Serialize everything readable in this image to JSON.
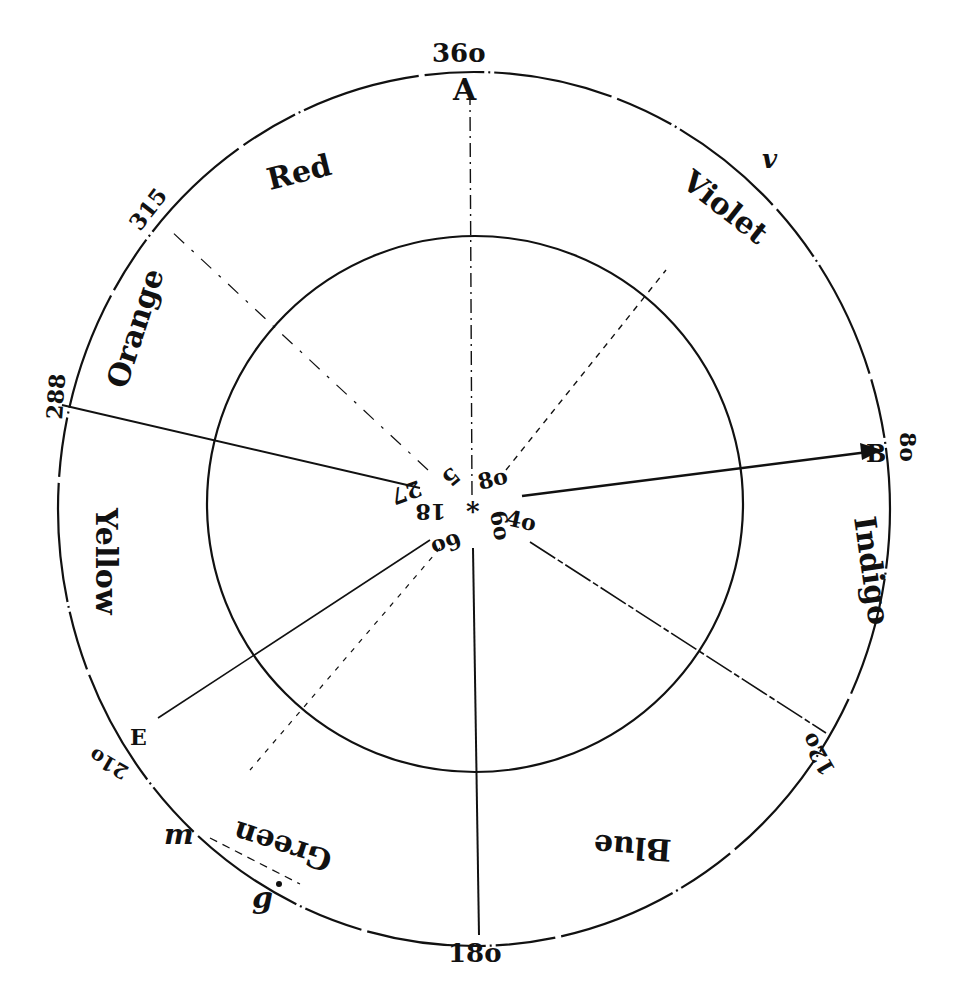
{
  "diagram": {
    "type": "color-wheel-angular-diagram",
    "ink_color": "#111111",
    "background": "#ffffff",
    "degree_labels": {
      "top": "36o",
      "upper_left": "315",
      "left": "288",
      "lower_left": "21o",
      "bottom": "18o",
      "lower_right": "12o",
      "right": "8o"
    },
    "point_letters": {
      "top": "A",
      "right": "B",
      "lower_left": "E",
      "upper_right": "v",
      "bottom_left_m": "m",
      "bottom_left_g": "g"
    },
    "color_bands": {
      "red": "Red",
      "violet": "Violet",
      "indigo": "Indigo",
      "blue": "Blue",
      "green": "Green",
      "yellow": "Yellow",
      "orange": "Orange"
    },
    "center_labels": {
      "upper_right": "8o",
      "right": "4o",
      "below": "6o",
      "lower_left": "6o",
      "left": "18",
      "upper_left_a": "27",
      "upper_left_b": "5"
    },
    "center_mark": "*"
  }
}
